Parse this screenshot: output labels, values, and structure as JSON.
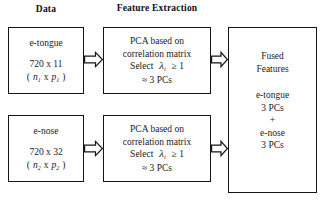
{
  "figure": {
    "background_color": "#ffffff",
    "line_color": "#151515"
  },
  "headers": {
    "data": "Data",
    "feature_extraction": "Feature Extraction"
  },
  "data_boxes": [
    {
      "name": "e-tongue",
      "label": "e-tongue",
      "dimensions": "720 x 11",
      "notation_open": "(",
      "notation_n": "n",
      "notation_n_sub": "1",
      "notation_x": "x",
      "notation_p": "p",
      "notation_p_sub": "1",
      "notation_close": ")",
      "rows": 720,
      "columns": 11
    },
    {
      "name": "e-nose",
      "label": "e-nose",
      "dimensions": "720 x 32",
      "notation_open": "(",
      "notation_n": "n",
      "notation_n_sub": "2",
      "notation_x": "x",
      "notation_p": "p",
      "notation_p_sub": "2",
      "notation_close": ")",
      "rows": 720,
      "columns": 32
    }
  ],
  "pca_boxes": [
    {
      "line1": "PCA based on",
      "line2": "correlation matrix",
      "select_label": "Select",
      "lambda": "λ",
      "lambda_sub": "i",
      "criterion": "≥ 1",
      "result": "≈ 3 PCs"
    },
    {
      "line1": "PCA based on",
      "line2": "correlation matrix",
      "select_label": "Select",
      "lambda": "λ",
      "lambda_sub": "i",
      "criterion": "≥ 1",
      "result": "≈ 3 PCs"
    }
  ],
  "fused_box": {
    "title_line1": "Fused",
    "title_line2": "Features",
    "item1_name": "e-tongue",
    "item1_value": "3 PCs",
    "operator": "+",
    "item2_name": "e-nose",
    "item2_value": "3 PCs"
  },
  "arrows": [
    {
      "id": "etongue-to-pca1",
      "direction": "right"
    },
    {
      "id": "pca1-to-fused",
      "direction": "right"
    },
    {
      "id": "enose-to-pca2",
      "direction": "right"
    },
    {
      "id": "pca2-to-fused",
      "direction": "right"
    }
  ]
}
